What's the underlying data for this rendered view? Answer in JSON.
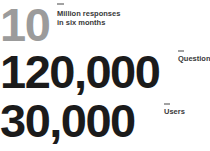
{
  "stats": [
    {
      "id": "responses",
      "value": "10",
      "label_line1": "Million responses",
      "label_line2": "in six months"
    },
    {
      "id": "questions",
      "value": "120,000",
      "label": "Questions"
    },
    {
      "id": "users",
      "value": "30,000",
      "label": "Users"
    }
  ],
  "colors": {
    "background": "#ffffff",
    "number_primary": "#1b1b1b",
    "number_muted": "#9b9b9b",
    "label_text": "#383838",
    "tick": "#a2a2a2"
  }
}
